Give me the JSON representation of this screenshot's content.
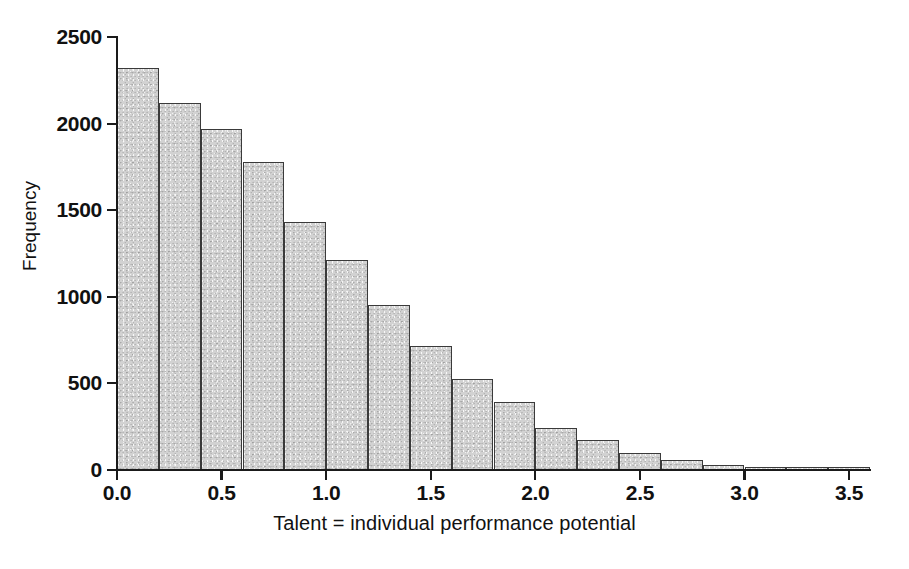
{
  "chart_data": {
    "type": "bar",
    "title": "",
    "subtitle": "",
    "xlabel": "Talent = individual performance potential",
    "ylabel": "Frequency",
    "xlim": [
      0.0,
      3.6
    ],
    "ylim": [
      0,
      2500
    ],
    "grid": false,
    "legend": null,
    "bin_width": 0.2,
    "bar_fill_color": "#d2d2d2",
    "bar_edge_color": "#3a3a3a",
    "axis_color": "#1a1a1a",
    "x_tick_labels": [
      "0.0",
      "0.5",
      "1.0",
      "1.5",
      "2.0",
      "2.5",
      "3.0",
      "3.5"
    ],
    "x_tick_values": [
      0.0,
      0.5,
      1.0,
      1.5,
      2.0,
      2.5,
      3.0,
      3.5
    ],
    "y_tick_labels": [
      "0",
      "500",
      "1000",
      "1500",
      "2000",
      "2500"
    ],
    "y_tick_values": [
      0,
      500,
      1000,
      1500,
      2000,
      2500
    ],
    "categories": [
      "0.0-0.2",
      "0.2-0.4",
      "0.4-0.6",
      "0.6-0.8",
      "0.8-1.0",
      "1.0-1.2",
      "1.2-1.4",
      "1.4-1.6",
      "1.6-1.8",
      "1.8-2.0",
      "2.0-2.2",
      "2.2-2.4",
      "2.4-2.6",
      "2.6-2.8",
      "2.8-3.0",
      "3.0-3.2",
      "3.2-3.4",
      "3.4-3.6"
    ],
    "bin_starts": [
      0.0,
      0.2,
      0.4,
      0.6,
      0.8,
      1.0,
      1.2,
      1.4,
      1.6,
      1.8,
      2.0,
      2.2,
      2.4,
      2.6,
      2.8,
      3.0,
      3.2,
      3.4
    ],
    "values": [
      2320,
      2120,
      1970,
      1780,
      1430,
      1215,
      955,
      715,
      525,
      395,
      240,
      175,
      100,
      58,
      30,
      14,
      6,
      2
    ]
  }
}
